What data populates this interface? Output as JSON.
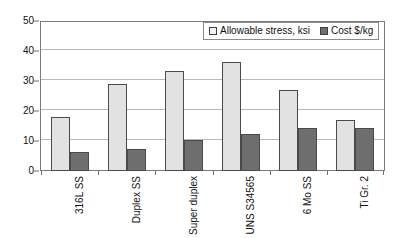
{
  "chart_data": {
    "type": "bar",
    "title": "",
    "subtitle": "",
    "xlabel": "",
    "ylabel": "",
    "ylim": [
      0,
      50
    ],
    "y_ticks": [
      0,
      10,
      20,
      30,
      40,
      50
    ],
    "grid": true,
    "legend_position": "top-right",
    "categories": [
      "316L SS",
      "Duplex SS",
      "Super duplex",
      "UNS S34565",
      "6 Mo SS",
      "Ti Gr. 2"
    ],
    "series": [
      {
        "name": "Allowable stress, ksi",
        "color": "#e2e2e2",
        "values": [
          18,
          29,
          33.5,
          36.5,
          27,
          17
        ]
      },
      {
        "name": "Cost $/kg",
        "color": "#6e6e6e",
        "values": [
          6.3,
          7.3,
          10.3,
          12.3,
          14.3,
          14.5
        ]
      }
    ]
  },
  "legend": {
    "entries": [
      {
        "label": "Allowable stress, ksi"
      },
      {
        "label": "Cost $/kg"
      }
    ]
  },
  "axes": {
    "y_tick_labels": [
      "0",
      "10",
      "20",
      "30",
      "40",
      "50"
    ]
  }
}
